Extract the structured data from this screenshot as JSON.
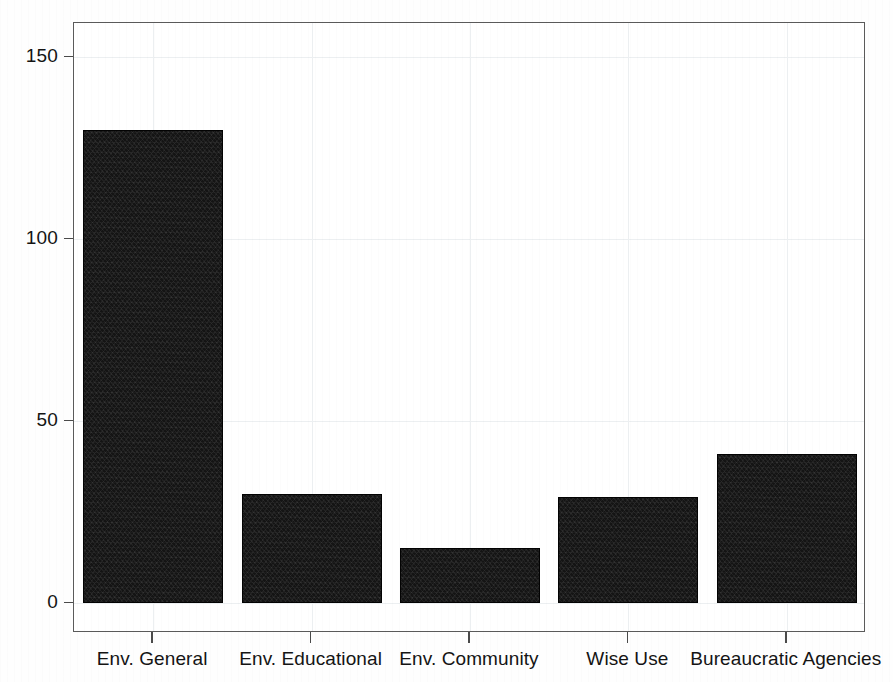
{
  "chart_data": {
    "type": "bar",
    "title": "",
    "subtitle": "",
    "xlabel": "",
    "ylabel": "",
    "categories": [
      "Env. General",
      "Env. Educational",
      "Env. Community",
      "Wise Use",
      "Bureaucratic Agencies"
    ],
    "values": [
      130,
      30,
      15,
      29,
      41
    ],
    "ylim": [
      0,
      163
    ],
    "yticks": [
      0,
      50,
      100,
      150
    ],
    "ytick_labels": [
      "0",
      "50",
      "100",
      "150"
    ],
    "grid": true,
    "grid_axis": "both",
    "legend": false,
    "legend_position": "none",
    "bar_color": "#141414",
    "frame_color": "#5a5a5a",
    "grid_color": "#eceff1",
    "text_color": "#141414",
    "background": "#ffffff"
  },
  "axes": {
    "y": {
      "ticks": [
        {
          "label": "150",
          "value": 150
        },
        {
          "label": "100",
          "value": 100
        },
        {
          "label": "50",
          "value": 50
        },
        {
          "label": "0",
          "value": 0
        }
      ]
    },
    "x": {
      "ticks": [
        {
          "label": "Env. General"
        },
        {
          "label": "Env. Educational"
        },
        {
          "label": "Env. Community"
        },
        {
          "label": "Wise Use"
        },
        {
          "label": "Bureaucratic Agencies"
        }
      ]
    }
  },
  "bars": [
    {
      "label": "Env. General",
      "value": 130
    },
    {
      "label": "Env. Educational",
      "value": 30
    },
    {
      "label": "Env. Community",
      "value": 15
    },
    {
      "label": "Wise Use",
      "value": 29
    },
    {
      "label": "Bureaucratic Agencies",
      "value": 41
    }
  ]
}
